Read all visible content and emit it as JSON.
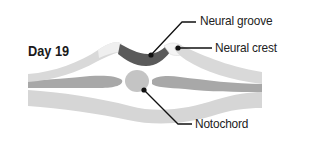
{
  "diagram": {
    "stage_label": "Day 19",
    "labels": {
      "neural_groove": "Neural groove",
      "neural_crest": "Neural crest",
      "notochord": "Notochord"
    },
    "colors": {
      "ectoderm_light": "#d9d9d9",
      "ectoderm_edge": "#e8e8e8",
      "neural_groove": "#5a5a5a",
      "neural_crest": "#f4f4f4",
      "mesoderm": "#a8a8a8",
      "notochord": "#c4c4c4",
      "endoderm": "#d6d6d6",
      "leader_line": "#111111",
      "background": "#ffffff"
    }
  }
}
